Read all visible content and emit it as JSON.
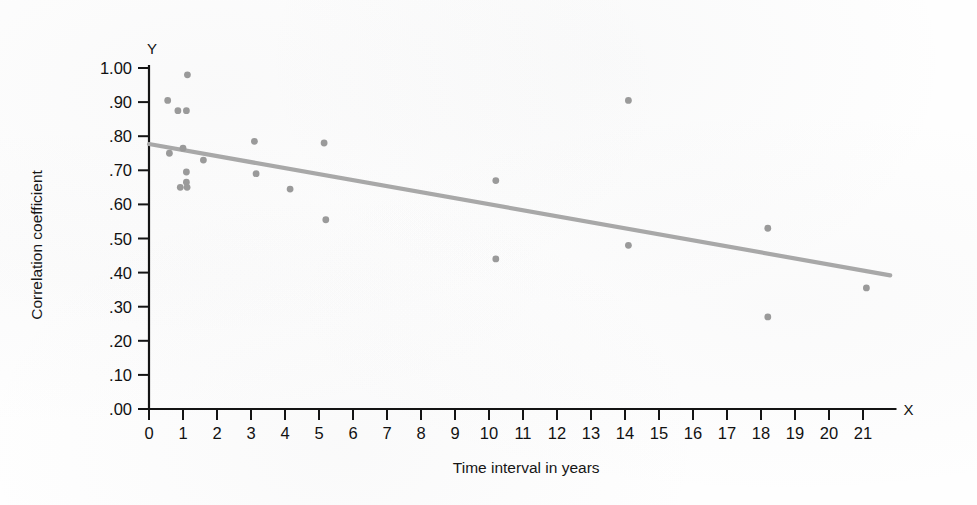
{
  "chart_data": {
    "type": "scatter",
    "title": "",
    "xlabel": "Time interval in years",
    "ylabel": "Correlation coefficient",
    "x_axis_name": "X",
    "y_axis_name": "Y",
    "xlim": [
      0,
      21.6
    ],
    "ylim": [
      0.0,
      1.0
    ],
    "grid": false,
    "legend": "none",
    "x_ticks": [
      0,
      1,
      2,
      3,
      4,
      5,
      6,
      7,
      8,
      9,
      10,
      11,
      12,
      13,
      14,
      15,
      16,
      17,
      18,
      19,
      20,
      21
    ],
    "x_tick_labels": [
      "0",
      "1",
      "2",
      "3",
      "4",
      "5",
      "6",
      "7",
      "8",
      "9",
      "10",
      "11",
      "12",
      "13",
      "14",
      "15",
      "16",
      "17",
      "18",
      "19",
      "20",
      "21"
    ],
    "y_ticks": [
      0.0,
      0.1,
      0.2,
      0.3,
      0.4,
      0.5,
      0.6,
      0.7,
      0.8,
      0.9,
      1.0
    ],
    "y_tick_labels": [
      ".00",
      ".10",
      ".20",
      ".30",
      ".40",
      ".50",
      ".60",
      ".70",
      ".80",
      ".90",
      "1.00"
    ],
    "points": [
      {
        "x": 0.55,
        "y": 0.905
      },
      {
        "x": 0.6,
        "y": 0.75
      },
      {
        "x": 0.85,
        "y": 0.875
      },
      {
        "x": 1.1,
        "y": 0.875
      },
      {
        "x": 1.13,
        "y": 0.98
      },
      {
        "x": 1.1,
        "y": 0.695
      },
      {
        "x": 1.1,
        "y": 0.665
      },
      {
        "x": 0.92,
        "y": 0.65
      },
      {
        "x": 1.12,
        "y": 0.65
      },
      {
        "x": 1.0,
        "y": 0.765
      },
      {
        "x": 1.6,
        "y": 0.73
      },
      {
        "x": 3.1,
        "y": 0.785
      },
      {
        "x": 3.15,
        "y": 0.69
      },
      {
        "x": 4.15,
        "y": 0.645
      },
      {
        "x": 5.15,
        "y": 0.78
      },
      {
        "x": 5.2,
        "y": 0.555
      },
      {
        "x": 10.2,
        "y": 0.67
      },
      {
        "x": 10.2,
        "y": 0.44
      },
      {
        "x": 14.1,
        "y": 0.905
      },
      {
        "x": 14.1,
        "y": 0.48
      },
      {
        "x": 18.2,
        "y": 0.53
      },
      {
        "x": 18.2,
        "y": 0.27
      },
      {
        "x": 21.1,
        "y": 0.355
      }
    ],
    "trend_line": {
      "x0": 0.0,
      "y0": 0.777,
      "x1": 21.8,
      "y1": 0.392,
      "color": "#a8a8a8"
    },
    "point_color": "#9a9a9a",
    "axis_color": "#141414"
  }
}
